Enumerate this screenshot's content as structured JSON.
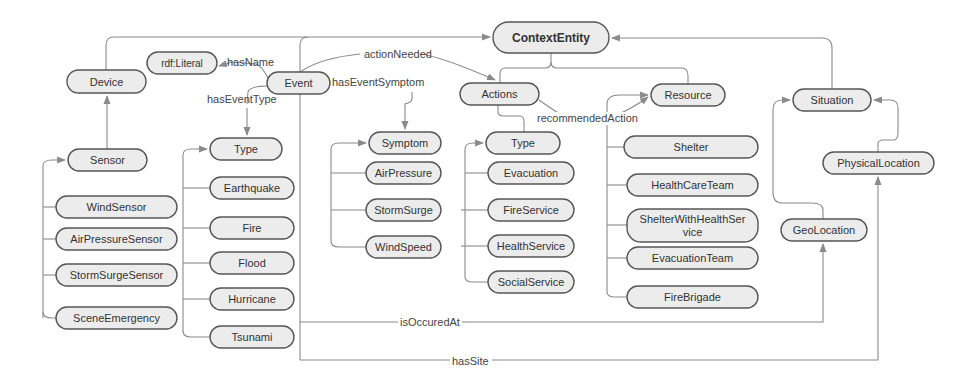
{
  "diagram": {
    "type": "ontology-class-diagram",
    "colors": {
      "node_fill": "#ececec",
      "node_stroke": "#555555",
      "edge": "#8a8a8a",
      "text": "#333333",
      "background": "#ffffff"
    },
    "nodes": [
      {
        "id": "contextentity",
        "label": "ContextEntity",
        "x": 493,
        "y": 22,
        "w": 116,
        "h": 31,
        "bold": true
      },
      {
        "id": "device",
        "label": "Device",
        "x": 67,
        "y": 70,
        "w": 79,
        "h": 23
      },
      {
        "id": "rdfliteral",
        "label": "rdf:Literal",
        "x": 147,
        "y": 52,
        "w": 70,
        "h": 22
      },
      {
        "id": "event",
        "label": "Event",
        "x": 267,
        "y": 72,
        "w": 63,
        "h": 22
      },
      {
        "id": "actions",
        "label": "Actions",
        "x": 460,
        "y": 83,
        "w": 79,
        "h": 22
      },
      {
        "id": "resource",
        "label": "Resource",
        "x": 651,
        "y": 84,
        "w": 74,
        "h": 22
      },
      {
        "id": "situation",
        "label": "Situation",
        "x": 793,
        "y": 89,
        "w": 78,
        "h": 22
      },
      {
        "id": "sensor",
        "label": "Sensor",
        "x": 68,
        "y": 149,
        "w": 79,
        "h": 22
      },
      {
        "id": "event-type",
        "label": "Type",
        "x": 210,
        "y": 138,
        "w": 72,
        "h": 22
      },
      {
        "id": "symptom",
        "label": "Symptom",
        "x": 369,
        "y": 132,
        "w": 72,
        "h": 22
      },
      {
        "id": "action-type",
        "label": "Type",
        "x": 486,
        "y": 132,
        "w": 74,
        "h": 22
      },
      {
        "id": "shelter",
        "label": "Shelter",
        "x": 624,
        "y": 136,
        "w": 134,
        "h": 22
      },
      {
        "id": "physicallocation",
        "label": "PhysicalLocation",
        "x": 823,
        "y": 152,
        "w": 111,
        "h": 22
      },
      {
        "id": "earthquake",
        "label": "Earthquake",
        "x": 210,
        "y": 177,
        "w": 84,
        "h": 22
      },
      {
        "id": "airpressure",
        "label": "AirPressure",
        "x": 366,
        "y": 162,
        "w": 75,
        "h": 22
      },
      {
        "id": "evacuation",
        "label": "Evacuation",
        "x": 488,
        "y": 162,
        "w": 86,
        "h": 22
      },
      {
        "id": "healthcareteam",
        "label": "HealthCareTeam",
        "x": 627,
        "y": 174,
        "w": 131,
        "h": 22
      },
      {
        "id": "windsensor",
        "label": "WindSensor",
        "x": 56,
        "y": 196,
        "w": 121,
        "h": 22
      },
      {
        "id": "fire",
        "label": "Fire",
        "x": 210,
        "y": 217,
        "w": 84,
        "h": 22
      },
      {
        "id": "stormsurge",
        "label": "StormSurge",
        "x": 366,
        "y": 199,
        "w": 75,
        "h": 22
      },
      {
        "id": "fireservice",
        "label": "FireService",
        "x": 488,
        "y": 199,
        "w": 86,
        "h": 22
      },
      {
        "id": "shelterwithhealthservice",
        "label": "ShelterWithHealthService",
        "label_lines": [
          "ShelterWithHealthSer",
          "vice"
        ],
        "x": 627,
        "y": 209,
        "w": 131,
        "h": 33
      },
      {
        "id": "geolocation",
        "label": "GeoLocation",
        "x": 781,
        "y": 219,
        "w": 86,
        "h": 22
      },
      {
        "id": "airpressuresensor",
        "label": "AirPressureSensor",
        "x": 56,
        "y": 228,
        "w": 121,
        "h": 22
      },
      {
        "id": "flood",
        "label": "Flood",
        "x": 210,
        "y": 252,
        "w": 84,
        "h": 22
      },
      {
        "id": "windspeed",
        "label": "WindSpeed",
        "x": 366,
        "y": 236,
        "w": 75,
        "h": 22
      },
      {
        "id": "healthservice",
        "label": "HealthService",
        "x": 488,
        "y": 235,
        "w": 86,
        "h": 22
      },
      {
        "id": "evacuationteam",
        "label": "EvacuationTeam",
        "x": 627,
        "y": 247,
        "w": 131,
        "h": 22
      },
      {
        "id": "stormsurgesensor",
        "label": "StormSurgeSensor",
        "x": 56,
        "y": 264,
        "w": 121,
        "h": 22
      },
      {
        "id": "socialservice",
        "label": "SocialService",
        "x": 488,
        "y": 271,
        "w": 86,
        "h": 22
      },
      {
        "id": "hurricane",
        "label": "Hurricane",
        "x": 210,
        "y": 288,
        "w": 84,
        "h": 22
      },
      {
        "id": "firebrigade",
        "label": "FireBrigade",
        "x": 627,
        "y": 286,
        "w": 131,
        "h": 22
      },
      {
        "id": "sceneemergency",
        "label": "SceneEmergency",
        "x": 56,
        "y": 307,
        "w": 121,
        "h": 22
      },
      {
        "id": "tsunami",
        "label": "Tsunami",
        "x": 210,
        "y": 326,
        "w": 84,
        "h": 22
      }
    ],
    "edge_labels": [
      {
        "id": "hasname",
        "text": "hasName",
        "x": 227,
        "y": 62
      },
      {
        "id": "haseventtype",
        "text": "hasEventType",
        "x": 207,
        "y": 99
      },
      {
        "id": "actionneeded",
        "text": "actionNeeded",
        "x": 364,
        "y": 54
      },
      {
        "id": "haseventsymptom",
        "text": "hasEventSymptom",
        "x": 332,
        "y": 82
      },
      {
        "id": "recommendedaction",
        "text": "recommendedAction",
        "x": 537,
        "y": 118
      },
      {
        "id": "isoccuredat",
        "text": "isOccuredAt",
        "x": 400,
        "y": 322
      },
      {
        "id": "hassite",
        "text": "hasSite",
        "x": 452,
        "y": 361
      }
    ]
  }
}
